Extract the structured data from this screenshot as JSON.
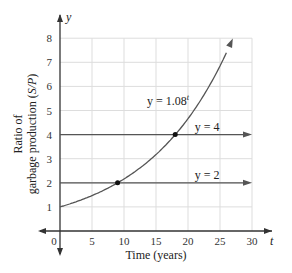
{
  "chart_data": {
    "type": "line",
    "title": "",
    "xlabel": "Time (years)",
    "ylabel_line1": "Ratio of",
    "ylabel_line2": "garbage production (S/P)",
    "x_axis_symbol": "t",
    "y_axis_symbol": "y",
    "xlim": [
      0,
      30
    ],
    "ylim": [
      0,
      8
    ],
    "x_ticks": [
      "0",
      "5",
      "10",
      "15",
      "20",
      "25",
      "30"
    ],
    "y_ticks": [
      "1",
      "2",
      "3",
      "4",
      "5",
      "6",
      "7",
      "8"
    ],
    "grid": true,
    "series": [
      {
        "name": "y = 1.08^t",
        "label_base": "y = 1.08",
        "label_exp": "t",
        "type": "exponential",
        "base": 1.08,
        "x": [
          0,
          5,
          9,
          10,
          15,
          18,
          20,
          25,
          27
        ],
        "y": [
          1.0,
          1.47,
          2.0,
          2.16,
          3.17,
          4.0,
          4.66,
          6.85,
          7.99
        ]
      },
      {
        "name": "y = 4",
        "label": "y = 4",
        "type": "horizontal",
        "value": 4,
        "x": [
          0,
          30
        ],
        "y": [
          4,
          4
        ]
      },
      {
        "name": "y = 2",
        "label": "y = 2",
        "type": "horizontal",
        "value": 2,
        "x": [
          0,
          30
        ],
        "y": [
          2,
          2
        ]
      }
    ],
    "points": [
      {
        "t": 9,
        "y": 2,
        "note": "intersection with y = 2"
      },
      {
        "t": 18,
        "y": 4,
        "note": "intersection with y = 4"
      }
    ],
    "colors": {
      "curve": "#555555",
      "axis": "#333333",
      "grid": "#dddddd",
      "point": "#111111"
    }
  }
}
